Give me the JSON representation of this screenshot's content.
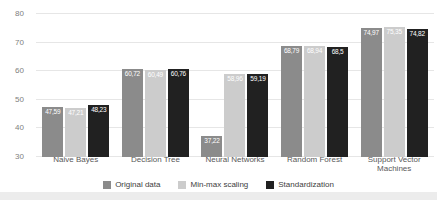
{
  "chart_data": {
    "type": "bar",
    "title": "",
    "xlabel": "",
    "ylabel": "",
    "categories": [
      "Naive Bayes",
      "Decision Tree",
      "Neural Networks",
      "Random Forest",
      "Support Vector Machines"
    ],
    "series": [
      {
        "name": "Original data",
        "color": "#8b8b8b",
        "values": [
          47.59,
          60.72,
          37.22,
          68.79,
          74.97
        ],
        "labels": [
          "47,59",
          "60,72",
          "37,22",
          "68,79",
          "74,97"
        ]
      },
      {
        "name": "Min-max scaling",
        "color": "#cccccc",
        "values": [
          47.21,
          60.49,
          58.96,
          68.94,
          75.35
        ],
        "labels": [
          "47,21",
          "60,49",
          "58,96",
          "68,94",
          "75,35"
        ]
      },
      {
        "name": "Standardization",
        "color": "#212121",
        "values": [
          48.23,
          60.76,
          59.19,
          68.5,
          74.82
        ],
        "labels": [
          "48,23",
          "60,76",
          "59,19",
          "68,5",
          "74,82"
        ]
      }
    ],
    "ylim": [
      30,
      80
    ],
    "yticks": [
      30,
      40,
      50,
      60,
      70,
      80
    ],
    "grid": true,
    "legend_position": "bottom",
    "value_label_color": "#ffffff",
    "gridline_color": "#e6e6e6"
  }
}
